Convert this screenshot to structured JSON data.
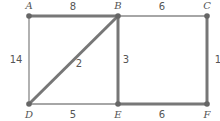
{
  "graph": {
    "vertices": [
      {
        "id": "A",
        "label": "A",
        "x": 29,
        "y": 16,
        "lx": 29,
        "ly": 9
      },
      {
        "id": "B",
        "label": "B",
        "x": 118,
        "y": 16,
        "lx": 118,
        "ly": 9
      },
      {
        "id": "C",
        "label": "C",
        "x": 207,
        "y": 16,
        "lx": 207,
        "ly": 9
      },
      {
        "id": "D",
        "label": "D",
        "x": 29,
        "y": 104,
        "lx": 29,
        "ly": 117
      },
      {
        "id": "E",
        "label": "E",
        "x": 118,
        "y": 104,
        "lx": 118,
        "ly": 117
      },
      {
        "id": "F",
        "label": "F",
        "x": 207,
        "y": 104,
        "lx": 207,
        "ly": 117
      }
    ],
    "edges": [
      {
        "from": "A",
        "to": "B",
        "weight": "8",
        "highlighted": true,
        "lx": 73,
        "ly": 9
      },
      {
        "from": "B",
        "to": "C",
        "weight": "6",
        "highlighted": false,
        "lx": 162,
        "ly": 9
      },
      {
        "from": "A",
        "to": "D",
        "weight": "14",
        "highlighted": false,
        "lx": 17,
        "ly": 63
      },
      {
        "from": "B",
        "to": "D",
        "weight": "2",
        "highlighted": true,
        "lx": 79,
        "ly": 66
      },
      {
        "from": "B",
        "to": "E",
        "weight": "3",
        "highlighted": true,
        "lx": 126,
        "ly": 63
      },
      {
        "from": "C",
        "to": "F",
        "weight": "1",
        "highlighted": true,
        "lx": 216,
        "ly": 63
      },
      {
        "from": "D",
        "to": "E",
        "weight": "5",
        "highlighted": false,
        "lx": 73,
        "ly": 117
      },
      {
        "from": "E",
        "to": "F",
        "weight": "6",
        "highlighted": true,
        "lx": 162,
        "ly": 117
      }
    ]
  },
  "colors": {
    "highlighted_edge": "#777777",
    "normal_edge": "#888888",
    "vertex": "#666666",
    "label": "#555555"
  }
}
